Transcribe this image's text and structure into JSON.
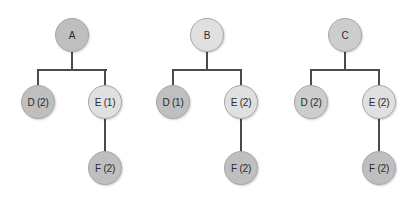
{
  "trees": [
    {
      "root": {
        "label": "A",
        "shade": "dark"
      },
      "left": {
        "label": "D (2)",
        "shade": "dark"
      },
      "right": {
        "label": "E (1)",
        "shade": "light"
      },
      "child": {
        "label": "F (2)",
        "shade": "dark"
      }
    },
    {
      "root": {
        "label": "B",
        "shade": "light"
      },
      "left": {
        "label": "D (1)",
        "shade": "dark"
      },
      "right": {
        "label": "E (2)",
        "shade": "light"
      },
      "child": {
        "label": "F (2)",
        "shade": "dark"
      }
    },
    {
      "root": {
        "label": "C",
        "shade": "mid"
      },
      "left": {
        "label": "D (2)",
        "shade": "mid"
      },
      "right": {
        "label": "E (2)",
        "shade": "light"
      },
      "child": {
        "label": "F (2)",
        "shade": "dark"
      }
    }
  ],
  "colors": {
    "dark": "#bfbfbf",
    "mid": "#cdcdcd",
    "light": "#e0e0e0",
    "edge": "#4a4a4a"
  }
}
